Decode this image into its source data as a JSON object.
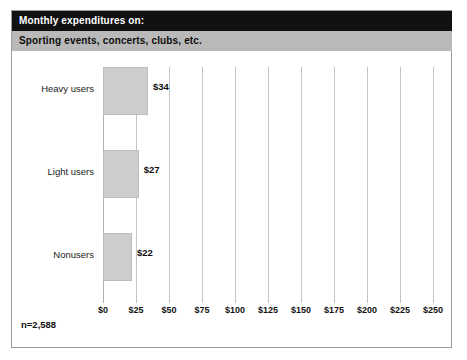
{
  "header": {
    "title_line1": "Monthly expenditures on:",
    "title_line2": "Sporting events, concerts, clubs, etc."
  },
  "footnote": "n=2,588",
  "colors": {
    "header_primary_bg": "#111111",
    "header_primary_text": "#ffffff",
    "header_secondary_bg": "#b9b9b9",
    "header_secondary_text": "#0d0d0d",
    "bar_fill": "#cdcdcd",
    "bar_stroke": "#bdbdbd",
    "gridline": "#c4c4c4",
    "frame_border": "#9a9a9a",
    "plot_bg": "#ffffff"
  },
  "chart_data": {
    "type": "bar",
    "orientation": "horizontal",
    "title": "Monthly expenditures on: Sporting events, concerts, clubs, etc.",
    "subtitle": "Sporting events, concerts, clubs, etc.",
    "categories": [
      "Heavy users",
      "Light users",
      "Nonusers"
    ],
    "values": [
      34,
      27,
      22
    ],
    "value_labels": [
      "$34",
      "$27",
      "$22"
    ],
    "xlabel": "",
    "ylabel": "",
    "xlim": [
      0,
      250
    ],
    "xticks": [
      0,
      25,
      50,
      75,
      100,
      125,
      150,
      175,
      200,
      225,
      250
    ],
    "xtick_labels": [
      "$0",
      "$25",
      "$50",
      "$75",
      "$100",
      "$125",
      "$150",
      "$175",
      "$200",
      "$225",
      "$250"
    ],
    "grid": true,
    "grid_axis": "x",
    "legend": false,
    "annotation": "n=2,588",
    "sample_size": 2588
  }
}
